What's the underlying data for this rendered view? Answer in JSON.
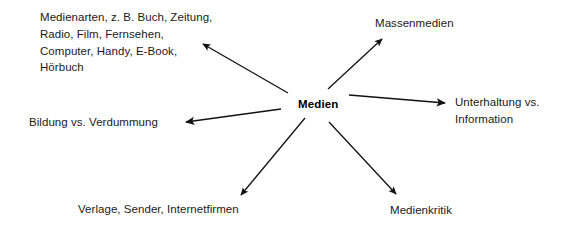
{
  "diagram": {
    "type": "mind-map",
    "title_node": "Medien",
    "center": {
      "label": "Medien",
      "x": 320,
      "y": 105
    },
    "branches": [
      {
        "id": "medienarten",
        "label": "Medienarten, z. B. Buch, Zeitung,\nRadio, Film, Fernsehen,\nComputer, Handy, E-Book,\nHörbuch",
        "direction": "upper-left",
        "arrow": {
          "x1": 288,
          "y1": 93,
          "x2": 203,
          "y2": 44
        }
      },
      {
        "id": "massenmedien",
        "label": "Massenmedien",
        "direction": "upper-right",
        "arrow": {
          "x1": 328,
          "y1": 89,
          "x2": 382,
          "y2": 39
        }
      },
      {
        "id": "unterhaltung-information",
        "label": "Unterhaltung vs.\nInformation",
        "direction": "right",
        "arrow": {
          "x1": 349,
          "y1": 95,
          "x2": 445,
          "y2": 103
        }
      },
      {
        "id": "bildung-verdummung",
        "label": "Bildung vs. Verdummung",
        "direction": "left",
        "arrow": {
          "x1": 281,
          "y1": 109,
          "x2": 186,
          "y2": 122
        }
      },
      {
        "id": "verlage-sender-internetfirmen",
        "label": "Verlage, Sender, Internetfirmen",
        "direction": "lower-left",
        "arrow": {
          "x1": 305,
          "y1": 118,
          "x2": 241,
          "y2": 195
        }
      },
      {
        "id": "medienkritik",
        "label": "Medienkritik",
        "direction": "lower-right",
        "arrow": {
          "x1": 329,
          "y1": 122,
          "x2": 396,
          "y2": 194
        }
      }
    ],
    "colors": {
      "background": "#ffffff",
      "text": "#1a1a1a",
      "center_text": "#000000",
      "arrow": "#111111"
    }
  }
}
